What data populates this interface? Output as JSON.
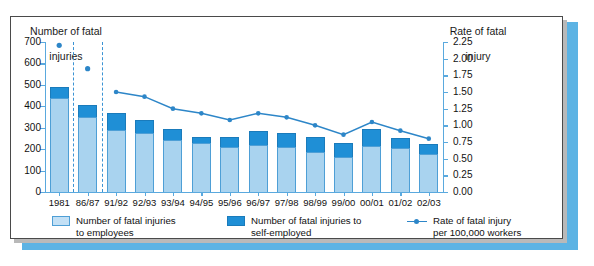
{
  "chart_data": {
    "type": "bar",
    "title": "",
    "ylabel": "Number of fatal\ninjuries",
    "ylabel_right": "Rate of fatal\ninjury",
    "xlabel": "",
    "categories": [
      "1981",
      "86/87",
      "91/92",
      "92/93",
      "93/94",
      "94/95",
      "95/96",
      "96/97",
      "97/98",
      "98/99",
      "99/00",
      "00/01",
      "01/02",
      "02/03"
    ],
    "ylim": [
      0,
      700
    ],
    "yticks": [
      0,
      100,
      200,
      300,
      400,
      500,
      600,
      700
    ],
    "ylim_right": [
      0,
      2.25
    ],
    "yticks_right": [
      "0.00",
      "0.25",
      "0.50",
      "0.75",
      "1.00",
      "1.25",
      "1.50",
      "1.75",
      "2.00",
      "2.25"
    ],
    "grid": false,
    "legend_position": "bottom",
    "series": [
      {
        "name": "Number of fatal injuries to employees",
        "type": "bar",
        "color": "#a9d3ef",
        "axis": "left",
        "values": [
          437,
          348,
          288,
          275,
          245,
          229,
          209,
          221,
          212,
          188,
          162,
          213,
          206,
          179
        ]
      },
      {
        "name": "Number of fatal injuries to self-employed",
        "type": "bar",
        "color": "#1f8fd6",
        "axis": "left",
        "values": [
          54,
          60,
          80,
          59,
          50,
          28,
          49,
          66,
          62,
          69,
          66,
          82,
          45,
          47
        ]
      },
      {
        "name": "Rate of fatal injury per 100,000 workers",
        "type": "line",
        "color": "#2d86c8",
        "axis": "right",
        "values": [
          2.2,
          1.85,
          1.5,
          1.43,
          1.25,
          1.18,
          1.08,
          1.18,
          1.12,
          1.0,
          0.86,
          1.05,
          0.92,
          0.8
        ]
      }
    ]
  },
  "axes": {
    "left_title_line1": "Number of fatal",
    "left_title_line2": "injuries",
    "right_title_line1": "Rate of fatal",
    "right_title_line2": "injury"
  },
  "legend": {
    "items": [
      {
        "label_line1": "Number of fatal injuries",
        "label_line2": "to employees",
        "swatch": "light-blue-square"
      },
      {
        "label_line1": "Number of fatal injuries to",
        "label_line2": "self-employed",
        "swatch": "dark-blue-square"
      },
      {
        "label_line1": "Rate of fatal injury",
        "label_line2": "per 100,000 workers",
        "swatch": "line-with-marker"
      }
    ]
  },
  "colors": {
    "bar_light": "#a9d3ef",
    "bar_dark": "#1f8fd6",
    "line": "#2d86c8",
    "axis": "#5aa9de",
    "accent_strip": "#5cb3e4",
    "panel_border": "#4a4a4a"
  }
}
